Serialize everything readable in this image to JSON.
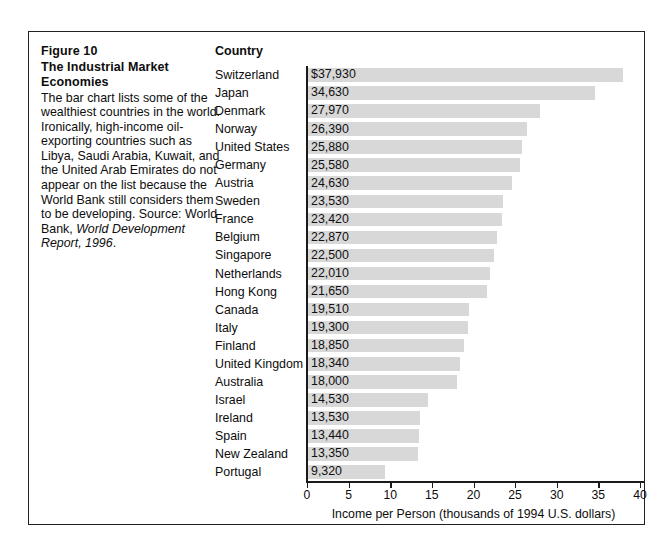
{
  "figure": {
    "label": "Figure 10",
    "title": "The Industrial Market Economies",
    "title_line1": "Figure 10",
    "title_line2": "The Industrial Market",
    "title_line3": "Economies",
    "caption_text": "The bar chart lists some of the wealthiest countries in the world. Ironically, high-income oil-exporting countries such as Libya, Saudi Arabia, Kuwait, and the United Arab Emirates do not appear on the list because the World Bank still considers them to be developing. Source: World Bank, ",
    "caption_source_italic": "World Development Report, 1996",
    "caption_tail": "."
  },
  "column_header": "Country",
  "chart_data": {
    "type": "bar",
    "orientation": "horizontal",
    "title": "The Industrial Market Economies",
    "xlabel": "Income per Person (thousands of 1994 U.S. dollars)",
    "ylabel": "Country",
    "xlim": [
      0,
      40
    ],
    "xticks": [
      0,
      5,
      10,
      15,
      20,
      25,
      30,
      35,
      40
    ],
    "xtick_labels": [
      "0",
      "5",
      "10",
      "15",
      "20",
      "25",
      "30",
      "35",
      "40"
    ],
    "grid": false,
    "legend": null,
    "bar_color": "#d8d8d8",
    "value_units": "1994 U.S. dollars",
    "categories": [
      "Switzerland",
      "Japan",
      "Denmark",
      "Norway",
      "United States",
      "Germany",
      "Austria",
      "Sweden",
      "France",
      "Belgium",
      "Singapore",
      "Netherlands",
      "Hong Kong",
      "Canada",
      "Italy",
      "Finland",
      "United Kingdom",
      "Australia",
      "Israel",
      "Ireland",
      "Spain",
      "New Zealand",
      "Portugal"
    ],
    "values": [
      37930,
      34630,
      27970,
      26390,
      25880,
      25580,
      24630,
      23530,
      23420,
      22870,
      22500,
      22010,
      21650,
      19510,
      19300,
      18850,
      18340,
      18000,
      14530,
      13530,
      13440,
      13350,
      9320
    ],
    "value_labels": [
      "$37,930",
      "34,630",
      "27,970",
      "26,390",
      "25,880",
      "25,580",
      "24,630",
      "23,530",
      "23,420",
      "22,870",
      "22,500",
      "22,010",
      "21,650",
      "19,510",
      "19,300",
      "18,850",
      "18,340",
      "18,000",
      "14,530",
      "13,530",
      "13,440",
      "13,350",
      "9,320"
    ]
  }
}
